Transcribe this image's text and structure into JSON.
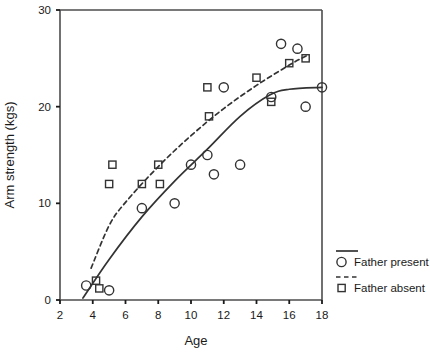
{
  "chart_data": {
    "type": "scatter",
    "title": "",
    "xlabel": "Age",
    "ylabel": "Arm strength (kgs)",
    "xlim": [
      2,
      18
    ],
    "ylim": [
      0,
      30
    ],
    "xticks": [
      2,
      4,
      6,
      8,
      10,
      12,
      14,
      16,
      18
    ],
    "yticks": [
      0,
      10,
      20,
      30
    ],
    "grid": false,
    "legend_position": "right",
    "series": [
      {
        "name": "Father present",
        "marker": "circle",
        "line_style": "solid",
        "color": "#333333",
        "points": [
          [
            3.6,
            1.5
          ],
          [
            5.0,
            1.0
          ],
          [
            7.0,
            9.5
          ],
          [
            9.0,
            10.0
          ],
          [
            10.0,
            14.0
          ],
          [
            11.0,
            15.0
          ],
          [
            11.4,
            13.0
          ],
          [
            12.0,
            22.0
          ],
          [
            13.0,
            14.0
          ],
          [
            14.9,
            21.0
          ],
          [
            15.5,
            26.5
          ],
          [
            16.5,
            26.0
          ],
          [
            17.0,
            20.0
          ],
          [
            18.0,
            22.0
          ]
        ],
        "fit_line": [
          [
            3.4,
            0.2
          ],
          [
            5.0,
            4.2
          ],
          [
            7.0,
            8.6
          ],
          [
            9.0,
            12.3
          ],
          [
            11.0,
            15.6
          ],
          [
            13.0,
            19.0
          ],
          [
            14.8,
            21.2
          ],
          [
            16.0,
            21.8
          ],
          [
            18.0,
            22.0
          ]
        ]
      },
      {
        "name": "Father absent",
        "marker": "square",
        "line_style": "dashed",
        "color": "#333333",
        "points": [
          [
            4.2,
            2.0
          ],
          [
            4.4,
            1.2
          ],
          [
            5.0,
            12.0
          ],
          [
            5.2,
            14.0
          ],
          [
            7.0,
            12.0
          ],
          [
            8.0,
            14.0
          ],
          [
            8.1,
            12.0
          ],
          [
            11.0,
            22.0
          ],
          [
            11.1,
            19.0
          ],
          [
            14.0,
            23.0
          ],
          [
            14.9,
            20.5
          ],
          [
            16.0,
            24.5
          ],
          [
            17.0,
            25.0
          ]
        ],
        "fit_line": [
          [
            3.9,
            3.3
          ],
          [
            5.0,
            7.7
          ],
          [
            6.0,
            10.1
          ],
          [
            8.0,
            13.8
          ],
          [
            10.0,
            17.0
          ],
          [
            12.0,
            19.8
          ],
          [
            14.0,
            22.2
          ],
          [
            16.0,
            24.3
          ],
          [
            17.2,
            25.4
          ]
        ]
      }
    ]
  },
  "legend": {
    "entries": [
      {
        "label": "Father present",
        "marker": "circle",
        "line": "solid"
      },
      {
        "label": "Father absent",
        "marker": "square",
        "line": "dashed"
      }
    ]
  }
}
